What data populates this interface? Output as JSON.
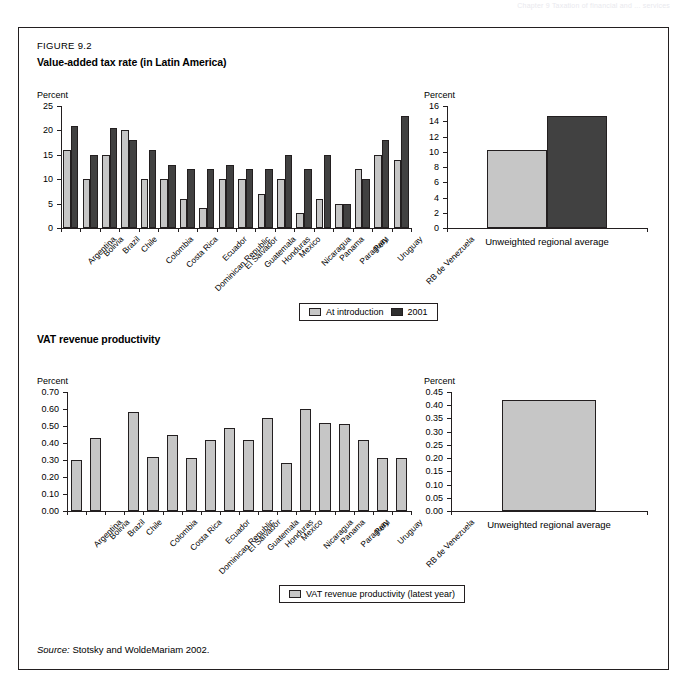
{
  "running_header": "Chapter 9  Taxation of financial and ... services",
  "figure": {
    "number": "FIGURE 9.2",
    "title": "Value-added tax rate (in Latin America)",
    "subtitle": "VAT revenue productivity",
    "source_label": "Source:",
    "source_text": "Stotsky and WoldeMariam 2002."
  },
  "colors": {
    "light": "#c6c6c6",
    "dark": "#414141",
    "border": "#231f20"
  },
  "legend_top": {
    "items": [
      {
        "label": "At introduction",
        "swatch": "light"
      },
      {
        "label": "2001",
        "swatch": "dark"
      }
    ]
  },
  "legend_bottom": {
    "items": [
      {
        "label": "VAT revenue productivity (latest year)",
        "swatch": "light"
      }
    ]
  },
  "chart_data": [
    {
      "id": "vat-rate-by-country",
      "type": "bar",
      "title": "Value-added tax rate (in Latin America)",
      "ylabel": "Percent",
      "xlabel": "",
      "ylim": [
        0,
        25
      ],
      "yticks": [
        0,
        5,
        10,
        15,
        20,
        25
      ],
      "ytick_labels": [
        "0",
        "5",
        "10",
        "15",
        "20",
        "25"
      ],
      "grid": false,
      "legend_position": "bottom-center",
      "categories": [
        "Argentina",
        "Bolivia",
        "Brazil",
        "Chile",
        "Colombia",
        "Costa Rica",
        "Dominican Republic",
        "Ecuador",
        "El Salvador",
        "Guatemala",
        "Honduras",
        "Mexico",
        "Nicaragua",
        "Panama",
        "Paraguay",
        "Peru",
        "Uruguay",
        "RB de Venezuela"
      ],
      "series": [
        {
          "name": "At introduction",
          "color": "light",
          "values": [
            16,
            10,
            15,
            20,
            10,
            10,
            6,
            4,
            10,
            10,
            7,
            10,
            3,
            6,
            5,
            12,
            15,
            14,
            10
          ]
        },
        {
          "name": "2001",
          "color": "dark",
          "values": [
            21,
            15,
            20.5,
            18,
            16,
            13,
            12,
            12,
            13,
            12,
            12,
            15,
            12,
            15,
            5,
            10,
            18,
            23,
            14.5
          ]
        }
      ]
    },
    {
      "id": "vat-rate-regional-average",
      "type": "bar",
      "ylabel": "Percent",
      "ylim": [
        0,
        16
      ],
      "yticks": [
        0,
        2,
        4,
        6,
        8,
        10,
        12,
        14,
        16
      ],
      "ytick_labels": [
        "0",
        "2",
        "4",
        "6",
        "8",
        "10",
        "12",
        "14",
        "16"
      ],
      "grid": false,
      "categories": [
        "Unweighted regional average"
      ],
      "series": [
        {
          "name": "At introduction",
          "color": "light",
          "values": [
            10.2
          ]
        },
        {
          "name": "2001",
          "color": "dark",
          "values": [
            14.7
          ]
        }
      ]
    },
    {
      "id": "vat-productivity-by-country",
      "type": "bar",
      "title": "VAT revenue productivity",
      "ylabel": "Percent",
      "ylim": [
        0,
        0.7
      ],
      "yticks": [
        0,
        0.1,
        0.2,
        0.3,
        0.4,
        0.5,
        0.6,
        0.7
      ],
      "ytick_labels": [
        "0.00",
        "0.10",
        "0.20",
        "0.30",
        "0.40",
        "0.50",
        "0.60",
        "0.70"
      ],
      "grid": false,
      "legend_position": "bottom-center",
      "categories": [
        "Argentina",
        "Bolivia",
        "Brazil",
        "Chile",
        "Colombia",
        "Costa Rica",
        "Dominican Republic",
        "Ecuador",
        "El Salvador",
        "Guatemala",
        "Honduras",
        "Mexico",
        "Nicaragua",
        "Panama",
        "Paraguay",
        "Peru",
        "Uruguay",
        "RB de Venezuela"
      ],
      "series": [
        {
          "name": "VAT revenue productivity (latest year)",
          "color": "light",
          "values": [
            0.3,
            0.43,
            null,
            0.58,
            0.32,
            0.45,
            0.31,
            0.42,
            0.49,
            0.42,
            0.55,
            0.28,
            0.6,
            0.52,
            0.51,
            0.42,
            0.31,
            0.31
          ]
        }
      ]
    },
    {
      "id": "vat-productivity-regional-average",
      "type": "bar",
      "ylabel": "Percent",
      "ylim": [
        0,
        0.45
      ],
      "yticks": [
        0,
        0.05,
        0.1,
        0.15,
        0.2,
        0.25,
        0.3,
        0.35,
        0.4,
        0.45
      ],
      "ytick_labels": [
        "0.00",
        "0.05",
        "0.10",
        "0.15",
        "0.20",
        "0.25",
        "0.30",
        "0.35",
        "0.40",
        "0.45"
      ],
      "grid": false,
      "categories": [
        "Unweighted regional average"
      ],
      "series": [
        {
          "name": "VAT revenue productivity (latest year)",
          "color": "light",
          "values": [
            0.42
          ]
        }
      ]
    }
  ]
}
